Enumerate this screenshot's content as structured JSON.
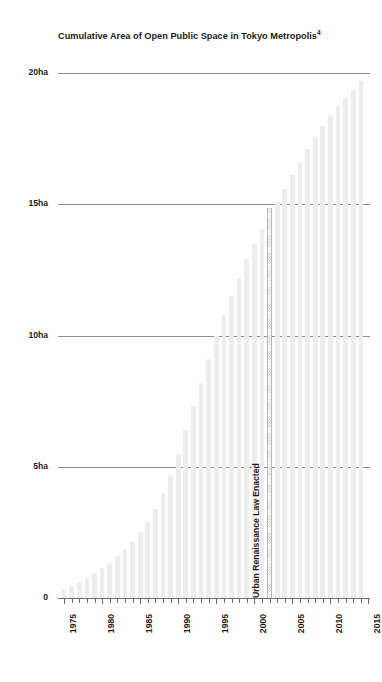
{
  "chart_data": {
    "type": "bar",
    "title": "Cumulative Area of Open Public Space in Tokyo Metropolis",
    "title_superscript": "4",
    "xlabel": "",
    "ylabel": "",
    "ylim": [
      0,
      20.8
    ],
    "xlim": [
      1974.2,
      2015.2
    ],
    "grid": true,
    "legend": "none",
    "unit": "ha",
    "y_tick_labels": [
      "20ha",
      "15ha",
      "10ha",
      "5ha",
      "0"
    ],
    "y_tick_values": [
      20,
      15,
      10,
      5,
      0
    ],
    "x_tick_labels": [
      "1975",
      "1980",
      "1985",
      "1990",
      "1995",
      "2000",
      "2005",
      "2010",
      "2015"
    ],
    "x_tick_values": [
      1975,
      1980,
      1985,
      1990,
      1995,
      2000,
      2005,
      2010,
      2015
    ],
    "bar_color": "#ededed",
    "gridline_color": "#8c8c8c",
    "text_color": "#1b1b1b",
    "categories": [
      1975,
      1976,
      1977,
      1978,
      1979,
      1980,
      1981,
      1982,
      1983,
      1984,
      1985,
      1986,
      1987,
      1988,
      1989,
      1990,
      1991,
      1992,
      1993,
      1994,
      1995,
      1996,
      1997,
      1998,
      1999,
      2000,
      2001,
      2002,
      2003,
      2004,
      2005,
      2006,
      2007,
      2008,
      2009,
      2010,
      2011,
      2012,
      2013,
      2014
    ],
    "values": [
      0.3,
      0.45,
      0.6,
      0.75,
      0.95,
      1.15,
      1.35,
      1.6,
      1.85,
      2.15,
      2.5,
      2.9,
      3.4,
      4.0,
      4.7,
      5.5,
      6.4,
      7.3,
      8.2,
      9.1,
      10.0,
      10.8,
      11.5,
      12.2,
      12.9,
      13.5,
      14.05,
      14.6,
      15.1,
      15.6,
      16.1,
      16.6,
      17.1,
      17.55,
      18.0,
      18.4,
      18.75,
      19.05,
      19.35,
      19.7
    ],
    "annotations": [
      {
        "label": "Urban Renaissance Law Enacted",
        "x": 2002,
        "y_top": 14.85,
        "style": "hatched-vertical-band"
      }
    ]
  }
}
